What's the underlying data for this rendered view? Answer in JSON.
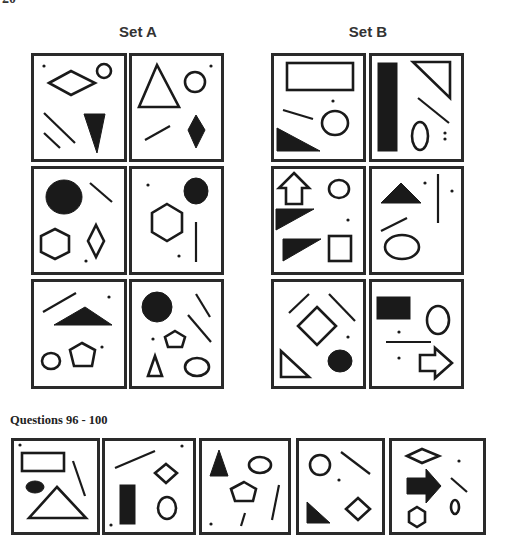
{
  "page_number": "20",
  "set_a": {
    "title": "Set A",
    "panels": [
      {
        "id": "a1",
        "box": [
          31,
          53,
          96,
          109
        ],
        "shapes": [
          {
            "t": "dot",
            "cx": 13,
            "cy": 13
          },
          {
            "t": "poly",
            "fill": false,
            "pts": "18,30 40,18 64,30 40,42"
          },
          {
            "t": "ellipse",
            "fill": false,
            "cx": 73,
            "cy": 18,
            "rx": 7,
            "ry": 7
          },
          {
            "t": "line",
            "x1": 13,
            "y1": 60,
            "x2": 44,
            "y2": 90
          },
          {
            "t": "line",
            "x1": 13,
            "y1": 80,
            "x2": 29,
            "y2": 95
          },
          {
            "t": "poly",
            "fill": true,
            "pts": "53,61 74,61 66,100"
          }
        ]
      },
      {
        "id": "a2",
        "box": [
          129,
          53,
          95,
          109
        ],
        "shapes": [
          {
            "t": "dot",
            "cx": 82,
            "cy": 13
          },
          {
            "t": "poly",
            "fill": false,
            "pts": "28,12 10,54 50,54"
          },
          {
            "t": "ellipse",
            "fill": false,
            "cx": 66,
            "cy": 29,
            "rx": 10,
            "ry": 10
          },
          {
            "t": "line",
            "x1": 16,
            "y1": 87,
            "x2": 41,
            "y2": 73
          },
          {
            "t": "poly",
            "fill": true,
            "pts": "67,62 76,77 67,95 59,77"
          }
        ]
      },
      {
        "id": "a3",
        "box": [
          31,
          166,
          96,
          109
        ],
        "shapes": [
          {
            "t": "ellipse",
            "fill": true,
            "cx": 33,
            "cy": 31,
            "rx": 18,
            "ry": 17
          },
          {
            "t": "line",
            "x1": 59,
            "y1": 17,
            "x2": 81,
            "y2": 36
          },
          {
            "t": "poly",
            "fill": false,
            "pts": "24,63 38,70 38,86 24,93 10,86 10,70"
          },
          {
            "t": "poly",
            "fill": false,
            "pts": "65,59 73,75 65,91 57,75"
          },
          {
            "t": "dot",
            "cx": 55,
            "cy": 95
          }
        ]
      },
      {
        "id": "a4",
        "box": [
          129,
          166,
          95,
          109
        ],
        "shapes": [
          {
            "t": "dot",
            "cx": 19,
            "cy": 19
          },
          {
            "t": "ellipse",
            "fill": true,
            "cx": 67,
            "cy": 25,
            "rx": 12,
            "ry": 13
          },
          {
            "t": "poly",
            "fill": false,
            "pts": "38,38 53,47 53,66 38,75 23,66 23,47"
          },
          {
            "t": "line",
            "x1": 67,
            "y1": 56,
            "x2": 67,
            "y2": 96
          },
          {
            "t": "dot",
            "cx": 50,
            "cy": 90
          }
        ]
      },
      {
        "id": "a5",
        "box": [
          31,
          279,
          96,
          110
        ],
        "shapes": [
          {
            "t": "line",
            "x1": 12,
            "y1": 33,
            "x2": 45,
            "y2": 14
          },
          {
            "t": "dot",
            "cx": 78,
            "cy": 18
          },
          {
            "t": "poly",
            "fill": true,
            "pts": "23,46 54,28 81,46"
          },
          {
            "t": "ellipse",
            "fill": false,
            "cx": 20,
            "cy": 82,
            "rx": 9,
            "ry": 8
          },
          {
            "t": "poly",
            "fill": false,
            "pts": "51,64 64,71 61,87 43,87 39,71"
          },
          {
            "t": "dot",
            "cx": 71,
            "cy": 68
          }
        ]
      },
      {
        "id": "a6",
        "box": [
          129,
          279,
          95,
          110
        ],
        "shapes": [
          {
            "t": "ellipse",
            "fill": true,
            "cx": 28,
            "cy": 28,
            "rx": 15,
            "ry": 15
          },
          {
            "t": "line",
            "x1": 67,
            "y1": 15,
            "x2": 81,
            "y2": 38
          },
          {
            "t": "line",
            "x1": 59,
            "y1": 36,
            "x2": 82,
            "y2": 63
          },
          {
            "t": "dot",
            "cx": 24,
            "cy": 60
          },
          {
            "t": "poly",
            "fill": false,
            "pts": "46,52 56,58 53,68 39,68 36,58"
          },
          {
            "t": "poly",
            "fill": false,
            "pts": "26,77 19,97 33,97"
          },
          {
            "t": "ellipse",
            "fill": false,
            "cx": 68,
            "cy": 88,
            "rx": 12,
            "ry": 9
          }
        ]
      }
    ]
  },
  "set_b": {
    "title": "Set B",
    "panels": [
      {
        "id": "b1",
        "box": [
          271,
          53,
          95,
          109
        ],
        "shapes": [
          {
            "t": "rect",
            "fill": false,
            "x": 16,
            "y": 10,
            "w": 66,
            "h": 27
          },
          {
            "t": "dot",
            "cx": 62,
            "cy": 48
          },
          {
            "t": "line",
            "x1": 12,
            "y1": 57,
            "x2": 42,
            "y2": 66
          },
          {
            "t": "ellipse",
            "fill": false,
            "cx": 64,
            "cy": 70,
            "rx": 13,
            "ry": 12
          },
          {
            "t": "poly",
            "fill": true,
            "pts": "6,75 6,98 49,98"
          }
        ]
      },
      {
        "id": "b2",
        "box": [
          369,
          53,
          95,
          109
        ],
        "shapes": [
          {
            "t": "rect",
            "fill": true,
            "x": 9,
            "y": 10,
            "w": 19,
            "h": 88
          },
          {
            "t": "poly",
            "fill": false,
            "pts": "44,9 81,9 81,45"
          },
          {
            "t": "line",
            "x1": 49,
            "y1": 45,
            "x2": 80,
            "y2": 70
          },
          {
            "t": "ellipse",
            "fill": false,
            "cx": 51,
            "cy": 83,
            "rx": 8,
            "ry": 14
          },
          {
            "t": "dot",
            "cx": 76,
            "cy": 80
          },
          {
            "t": "dot",
            "cx": 76,
            "cy": 86
          }
        ]
      },
      {
        "id": "b3",
        "box": [
          271,
          166,
          95,
          109
        ],
        "shapes": [
          {
            "t": "poly",
            "fill": false,
            "pts": "23,7 38,22 31,22 31,38 15,38 15,22 8,22"
          },
          {
            "t": "ellipse",
            "fill": false,
            "cx": 68,
            "cy": 23,
            "rx": 10,
            "ry": 9
          },
          {
            "t": "poly",
            "fill": true,
            "pts": "5,43 43,43 5,64"
          },
          {
            "t": "dot",
            "cx": 77,
            "cy": 54
          },
          {
            "t": "poly",
            "fill": true,
            "pts": "12,73 50,73 12,95"
          },
          {
            "t": "rect",
            "fill": false,
            "x": 58,
            "y": 70,
            "w": 22,
            "h": 25
          }
        ]
      },
      {
        "id": "b4",
        "box": [
          369,
          166,
          95,
          109
        ],
        "shapes": [
          {
            "t": "poly",
            "fill": true,
            "pts": "32,17 52,37 12,37"
          },
          {
            "t": "dot",
            "cx": 56,
            "cy": 17
          },
          {
            "t": "line",
            "x1": 69,
            "y1": 8,
            "x2": 69,
            "y2": 57
          },
          {
            "t": "dot",
            "cx": 83,
            "cy": 25
          },
          {
            "t": "line",
            "x1": 12,
            "y1": 65,
            "x2": 38,
            "y2": 52
          },
          {
            "t": "ellipse",
            "fill": false,
            "cx": 33,
            "cy": 81,
            "rx": 17,
            "ry": 12
          }
        ]
      },
      {
        "id": "b5",
        "box": [
          271,
          279,
          95,
          110
        ],
        "shapes": [
          {
            "t": "line",
            "x1": 18,
            "y1": 34,
            "x2": 38,
            "y2": 15
          },
          {
            "t": "line",
            "x1": 58,
            "y1": 15,
            "x2": 84,
            "y2": 42
          },
          {
            "t": "poly",
            "fill": false,
            "pts": "46,28 65,47 46,66 27,47"
          },
          {
            "t": "dot",
            "cx": 77,
            "cy": 58
          },
          {
            "t": "poly",
            "fill": false,
            "pts": "10,72 10,98 38,98"
          },
          {
            "t": "ellipse",
            "fill": true,
            "cx": 69,
            "cy": 82,
            "rx": 12,
            "ry": 11
          }
        ]
      },
      {
        "id": "b6",
        "box": [
          369,
          279,
          95,
          110
        ],
        "shapes": [
          {
            "t": "rect",
            "fill": true,
            "x": 8,
            "y": 18,
            "w": 33,
            "h": 22
          },
          {
            "t": "ellipse",
            "fill": false,
            "cx": 69,
            "cy": 41,
            "rx": 11,
            "ry": 14
          },
          {
            "t": "dot",
            "cx": 30,
            "cy": 53
          },
          {
            "t": "line",
            "x1": 17,
            "y1": 63,
            "x2": 62,
            "y2": 63
          },
          {
            "t": "dot",
            "cx": 30,
            "cy": 79
          },
          {
            "t": "poly",
            "fill": false,
            "pts": "51,76 66,76 66,69 83,84 66,99 66,92 51,92"
          }
        ]
      }
    ]
  },
  "questions": {
    "label": "Questions 96 - 100",
    "panels": [
      {
        "id": "q96",
        "box": [
          11,
          438,
          89,
          97
        ],
        "shapes": [
          {
            "t": "dot",
            "cx": 9,
            "cy": 7
          },
          {
            "t": "rect",
            "fill": false,
            "x": 11,
            "y": 15,
            "w": 42,
            "h": 18
          },
          {
            "t": "line",
            "x1": 62,
            "y1": 23,
            "x2": 74,
            "y2": 58
          },
          {
            "t": "ellipse",
            "fill": true,
            "cx": 24,
            "cy": 49,
            "rx": 9,
            "ry": 6
          },
          {
            "t": "poly",
            "fill": false,
            "pts": "46,49 75,80 18,80"
          }
        ]
      },
      {
        "id": "q97",
        "box": [
          102,
          438,
          94,
          97
        ],
        "shapes": [
          {
            "t": "dot",
            "cx": 80,
            "cy": 8
          },
          {
            "t": "line",
            "x1": 13,
            "y1": 30,
            "x2": 53,
            "y2": 13
          },
          {
            "t": "poly",
            "fill": false,
            "pts": "64,26 75,35 64,45 53,35"
          },
          {
            "t": "rect",
            "fill": true,
            "x": 18,
            "y": 47,
            "w": 15,
            "h": 39
          },
          {
            "t": "ellipse",
            "fill": false,
            "cx": 65,
            "cy": 70,
            "rx": 9,
            "ry": 11
          },
          {
            "t": "dot",
            "cx": 9,
            "cy": 87
          }
        ]
      },
      {
        "id": "q98",
        "box": [
          199,
          438,
          92,
          97
        ],
        "shapes": [
          {
            "t": "poly",
            "fill": true,
            "pts": "20,12 29,38 11,38"
          },
          {
            "t": "ellipse",
            "fill": false,
            "cx": 61,
            "cy": 27,
            "rx": 11,
            "ry": 8
          },
          {
            "t": "poly",
            "fill": false,
            "pts": "45,44 57,51 54,63 36,63 32,51"
          },
          {
            "t": "line",
            "x1": 80,
            "y1": 47,
            "x2": 73,
            "y2": 82
          },
          {
            "t": "line",
            "x1": 46,
            "y1": 75,
            "x2": 42,
            "y2": 88
          },
          {
            "t": "dot",
            "cx": 12,
            "cy": 86
          }
        ]
      },
      {
        "id": "q99",
        "box": [
          296,
          438,
          89,
          97
        ],
        "shapes": [
          {
            "t": "ellipse",
            "fill": false,
            "cx": 24,
            "cy": 27,
            "rx": 10,
            "ry": 10
          },
          {
            "t": "line",
            "x1": 45,
            "y1": 14,
            "x2": 74,
            "y2": 36
          },
          {
            "t": "dot",
            "cx": 43,
            "cy": 42
          },
          {
            "t": "poly",
            "fill": true,
            "pts": "11,64 11,85 34,85"
          },
          {
            "t": "poly",
            "fill": false,
            "pts": "62,60 74,71 62,82 50,71"
          }
        ]
      },
      {
        "id": "q100",
        "box": [
          389,
          438,
          97,
          97
        ],
        "shapes": [
          {
            "t": "poly",
            "fill": false,
            "pts": "18,18 33,11 50,18 33,25"
          },
          {
            "t": "dot",
            "cx": 70,
            "cy": 23
          },
          {
            "t": "poly",
            "fill": true,
            "pts": "18,40 37,40 37,31 52,48 37,65 37,56 18,56"
          },
          {
            "t": "line",
            "x1": 62,
            "y1": 40,
            "x2": 78,
            "y2": 54
          },
          {
            "t": "ellipse",
            "fill": false,
            "cx": 66,
            "cy": 69,
            "rx": 4,
            "ry": 7
          },
          {
            "t": "poly",
            "fill": false,
            "pts": "28,69 36,74 36,84 28,89 20,84 20,74"
          }
        ]
      }
    ]
  }
}
